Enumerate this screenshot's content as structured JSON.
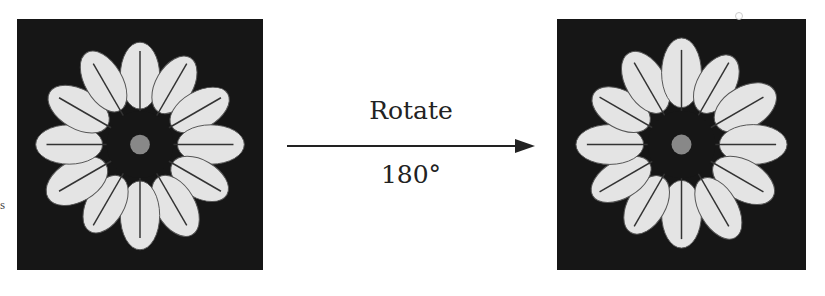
{
  "figure": {
    "left_panel": {
      "description": "Rosette plant image (original orientation)",
      "petal_count": 12
    },
    "right_panel": {
      "description": "Rosette plant image rotated 180 degrees",
      "petal_count": 12
    },
    "arrow": {
      "label_top": "Rotate",
      "label_bottom": "180°",
      "direction": "right"
    },
    "side_text": "s",
    "colors": {
      "background": "#ffffff",
      "panel": "#161616",
      "petal": "#e6e6e6",
      "arrow": "#222222"
    }
  }
}
